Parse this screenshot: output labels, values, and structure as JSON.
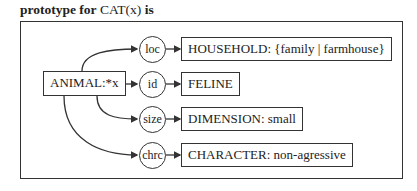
{
  "title": {
    "prefix": "prototype for",
    "concept": "CAT(x)",
    "suffix": "is"
  },
  "graph": {
    "source": {
      "label": "ANIMAL:*x"
    },
    "relations": [
      {
        "relation": "loc",
        "target": "HOUSEHOLD: {family | farmhouse}"
      },
      {
        "relation": "id",
        "target": "FELINE"
      },
      {
        "relation": "size",
        "target": "DIMENSION: small"
      },
      {
        "relation": "chrc",
        "target": "CHARACTER: non-agressive"
      }
    ]
  },
  "colors": {
    "line": "#333333",
    "background": "#ffffff"
  }
}
